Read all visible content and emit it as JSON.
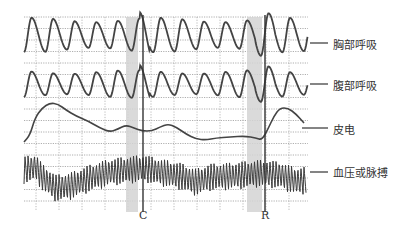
{
  "chart_data": {
    "type": "line",
    "title": "",
    "xlabel": "",
    "ylabel": "",
    "grid": true,
    "legend_position": "right (leader lines)",
    "channels": [
      {
        "name": "胸部呼吸",
        "kind": "respiration-thoracic",
        "baseline_y": 35,
        "amplitude": 15,
        "cycles": 13
      },
      {
        "name": "腹部呼吸",
        "kind": "respiration-abdominal",
        "baseline_y": 84,
        "amplitude": 12,
        "cycles": 13
      },
      {
        "name": "皮电",
        "kind": "galvanic-skin-response",
        "points": [
          [
            24,
            142
          ],
          [
            30,
            135
          ],
          [
            35,
            118
          ],
          [
            42,
            108
          ],
          [
            50,
            103
          ],
          [
            58,
            104
          ],
          [
            66,
            110
          ],
          [
            76,
            116
          ],
          [
            88,
            121
          ],
          [
            100,
            128
          ],
          [
            110,
            132
          ],
          [
            118,
            129
          ],
          [
            126,
            125
          ],
          [
            134,
            128
          ],
          [
            142,
            131
          ],
          [
            152,
            131
          ],
          [
            160,
            127
          ],
          [
            168,
            124
          ],
          [
            176,
            127
          ],
          [
            186,
            134
          ],
          [
            196,
            139
          ],
          [
            206,
            140
          ],
          [
            216,
            138
          ],
          [
            230,
            137
          ],
          [
            245,
            136
          ],
          [
            256,
            138
          ],
          [
            262,
            140
          ],
          [
            268,
            129
          ],
          [
            274,
            116
          ],
          [
            280,
            108
          ],
          [
            288,
            108
          ],
          [
            296,
            114
          ],
          [
            304,
            123
          ]
        ]
      },
      {
        "name": "血压或脉搏",
        "kind": "blood-pressure-pulse",
        "center_points": [
          [
            24,
            170
          ],
          [
            36,
            167
          ],
          [
            42,
            177
          ],
          [
            56,
            188
          ],
          [
            70,
            186
          ],
          [
            90,
            178
          ],
          [
            110,
            172
          ],
          [
            126,
            170
          ],
          [
            144,
            168
          ],
          [
            160,
            172
          ],
          [
            180,
            176
          ],
          [
            196,
            182
          ],
          [
            210,
            177
          ],
          [
            230,
            176
          ],
          [
            250,
            174
          ],
          [
            262,
            173
          ],
          [
            280,
            175
          ],
          [
            296,
            181
          ],
          [
            306,
            180
          ]
        ],
        "pulse_half_amplitude": 14,
        "pulse_period_px": 3.1
      }
    ],
    "events": [
      {
        "label": "C",
        "x": 143,
        "shade_x": [
          126,
          138
        ]
      },
      {
        "label": "R",
        "x": 265,
        "shade_x": [
          247,
          262
        ]
      }
    ],
    "plot_area": {
      "x": [
        24,
        308
      ],
      "y": [
        17,
        210
      ]
    }
  },
  "labels": {
    "thoracic": "胸部呼吸",
    "abdominal": "腹部呼吸",
    "gsr": "皮电",
    "bp": "血压或脉搏",
    "marker_c": "C",
    "marker_r": "R"
  }
}
